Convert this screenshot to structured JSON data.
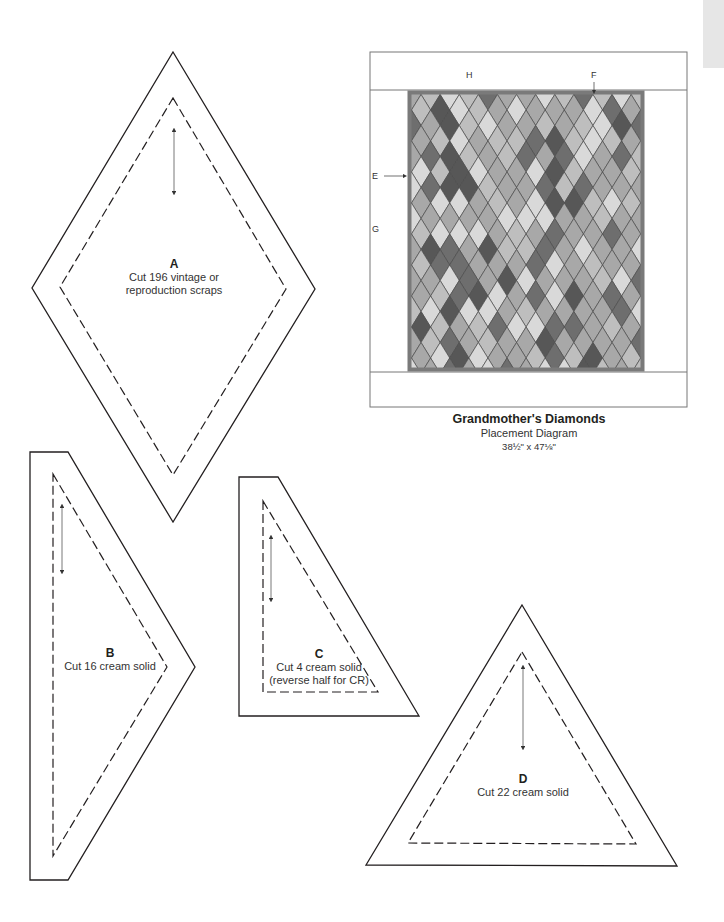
{
  "quilt": {
    "title": "Grandmother's Diamonds",
    "subtitle": "Placement Diagram",
    "size": "38½\" x 47⅛\"",
    "border_labels": {
      "E": "E",
      "F": "F",
      "G": "G",
      "H": "H"
    },
    "colors": {
      "border": "#8a8a8a",
      "frame": "#6f6f6f",
      "light": "#d9d9d9",
      "mid": "#a8a8a8",
      "midlight": "#bebebe",
      "dark": "#6e6e6e",
      "darkest": "#575757"
    }
  },
  "templates": [
    {
      "id": "A",
      "letter": "A",
      "lines": [
        "Cut 196 vintage or",
        "reproduction scraps"
      ]
    },
    {
      "id": "B",
      "letter": "B",
      "lines": [
        "Cut 16 cream solid"
      ]
    },
    {
      "id": "C",
      "letter": "C",
      "lines": [
        "Cut 4 cream solid",
        "(reverse half for CR)"
      ]
    },
    {
      "id": "D",
      "letter": "D",
      "lines": [
        "Cut 22 cream solid"
      ]
    }
  ]
}
